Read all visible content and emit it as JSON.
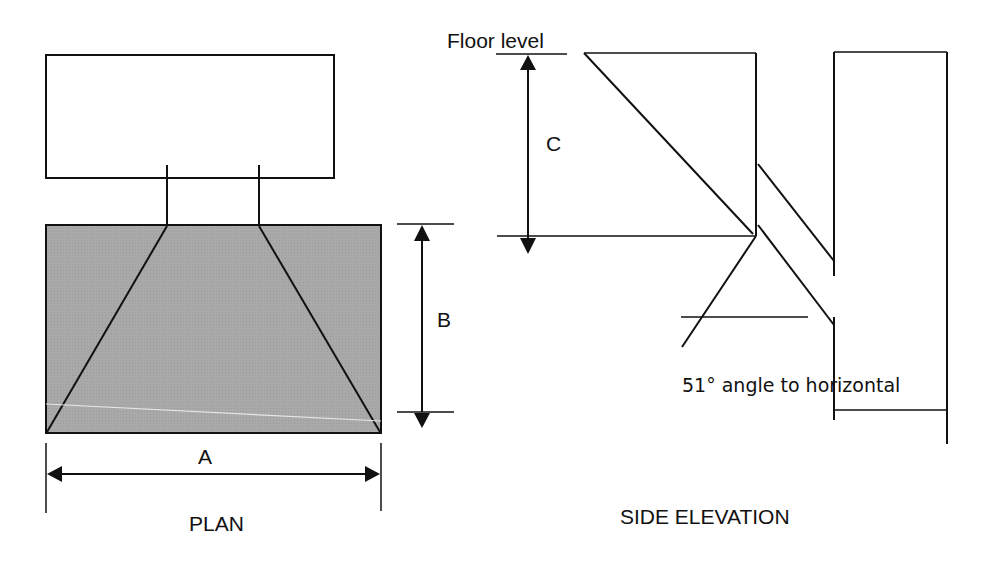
{
  "plan": {
    "title": "PLAN",
    "dim_a": "A",
    "dim_b": "B"
  },
  "side_elevation": {
    "title": "SIDE ELEVATION",
    "floor_label": "Floor level",
    "dim_c": "C",
    "angle_label": "51° angle to horizontal"
  },
  "colors": {
    "stroke": "#111111",
    "plan_fill": "#a6a6a6",
    "background": "#ffffff"
  }
}
